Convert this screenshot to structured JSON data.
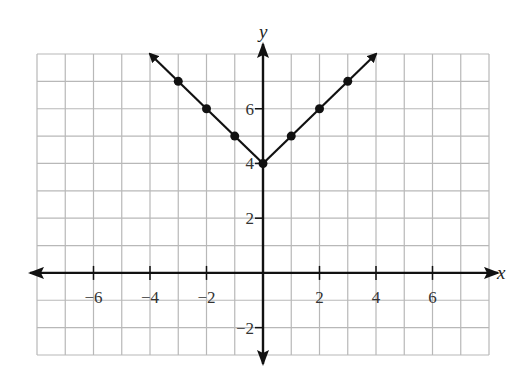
{
  "chart_data": {
    "type": "line",
    "title": "",
    "function": "y = |x| + 4",
    "xlabel": "x",
    "ylabel": "y",
    "xlim": [
      -8,
      8
    ],
    "ylim": [
      -3,
      8
    ],
    "grid": true,
    "grid_step": 1,
    "x_ticks": [
      -6,
      -4,
      -2,
      2,
      4,
      6
    ],
    "x_tick_labels": [
      "−6",
      "−4",
      "−2",
      "2",
      "4",
      "6"
    ],
    "y_ticks": [
      -2,
      2,
      4,
      6
    ],
    "y_tick_labels": [
      "−2",
      "2",
      "4",
      "6"
    ],
    "series": [
      {
        "name": "y = |x| + 4",
        "points": [
          [
            -3,
            7
          ],
          [
            -2,
            6
          ],
          [
            -1,
            5
          ],
          [
            0,
            4
          ],
          [
            1,
            5
          ],
          [
            2,
            6
          ],
          [
            3,
            7
          ]
        ],
        "x": [
          -3,
          -2,
          -1,
          0,
          1,
          2,
          3
        ],
        "values": [
          7,
          6,
          5,
          4,
          5,
          6,
          7
        ],
        "arrow_ends": [
          [
            -4,
            8
          ],
          [
            4,
            8
          ]
        ],
        "color": "#111111"
      }
    ],
    "legend": null
  },
  "colors": {
    "grid": "#b8b8b8",
    "axis": "#111111",
    "line": "#111111",
    "text": "#333333"
  }
}
